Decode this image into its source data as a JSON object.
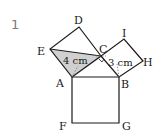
{
  "problem_number": "1",
  "points": {
    "A": "A",
    "B": "B",
    "C": "C",
    "D": "D",
    "E": "E",
    "F": "F",
    "G": "G",
    "H": "H",
    "I": "I"
  },
  "measurements": {
    "AC": "4 cm",
    "BC": "3 cm"
  },
  "colors": {
    "stroke": "#1a1a1a",
    "shaded": "#d0d0d0",
    "dashed": "#777777"
  }
}
